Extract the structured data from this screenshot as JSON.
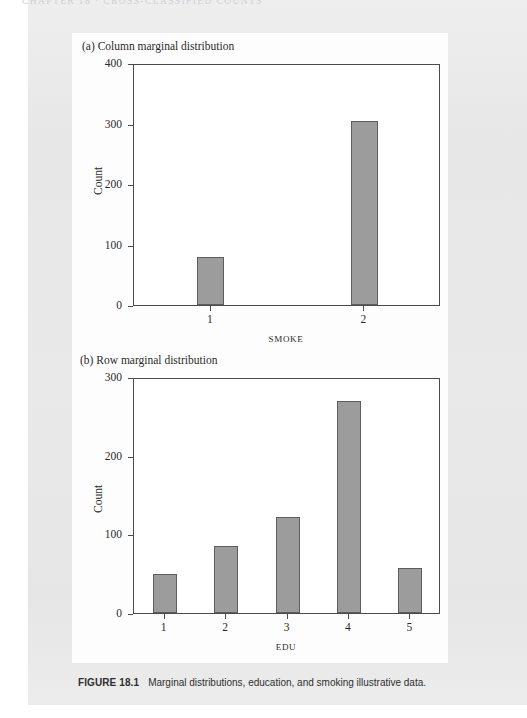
{
  "page": {
    "running_head": "CHAPTER 18  ·  CROSS-CLASSIFIED COUNTS",
    "background_color": "#e8e8e8",
    "panel_color": "#fdfdfd"
  },
  "caption": {
    "figure_number": "FIGURE 18.1",
    "text": "Marginal distributions, education, and smoking illustrative data."
  },
  "chart_data": [
    {
      "type": "bar",
      "panel_label": "(a)",
      "title": "(a)  Column marginal distribution",
      "categories": [
        "1",
        "2"
      ],
      "values": [
        80,
        304
      ],
      "xlabel": "SMOKE",
      "ylabel": "Count",
      "ylim": [
        0,
        400
      ],
      "yticks": [
        0,
        100,
        200,
        300,
        400
      ],
      "ytick_labels": [
        "0",
        "100",
        "200",
        "300",
        "400"
      ],
      "grid": false,
      "legend": "none",
      "bar_color": "#9c9c9c",
      "bar_edge_color": "#5d5d5d"
    },
    {
      "type": "bar",
      "panel_label": "(b)",
      "title": "(b) Row marginal distribution",
      "categories": [
        "1",
        "2",
        "3",
        "4",
        "5"
      ],
      "values": [
        50,
        85,
        122,
        270,
        57
      ],
      "xlabel": "EDU",
      "ylabel": "Count",
      "ylim": [
        0,
        300
      ],
      "yticks": [
        0,
        100,
        200,
        300
      ],
      "ytick_labels": [
        "0",
        "100",
        "200",
        "300"
      ],
      "grid": false,
      "legend": "none",
      "bar_color": "#9c9c9c",
      "bar_edge_color": "#5d5d5d"
    }
  ]
}
